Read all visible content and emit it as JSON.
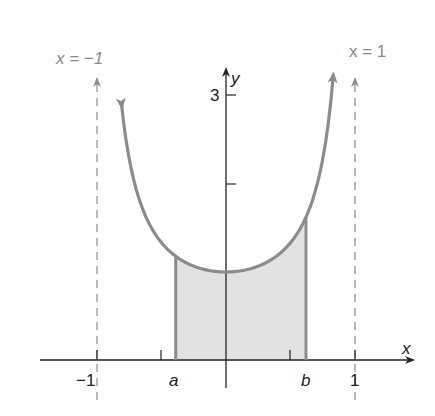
{
  "figure": {
    "vertical_asymptote_left_label": "x = −1",
    "vertical_asymptote_right_label": "x = 1",
    "y_axis_label": "y",
    "x_axis_label": "x",
    "y_tick_label_3": "3",
    "x_tick_labels": {
      "neg_one": "−1",
      "a": "a",
      "b": "b",
      "one": "1"
    },
    "colors": {
      "curve": "#8c8c8c",
      "asymptote": "#8a8a8a",
      "axis": "#222222",
      "shade": "#e2e2e2",
      "bounds": "#8c8c8c"
    }
  },
  "chart_data": {
    "type": "line",
    "title": "",
    "function": "y = 1/(1 - x^2) on (-1, 1), shaded region between x = a and x = b",
    "xlabel": "x",
    "ylabel": "y",
    "x_ticks": [
      "-1",
      "a",
      "b",
      "1"
    ],
    "y_ticks": [
      2,
      3
    ],
    "y_tick_labels": [
      "",
      "3"
    ],
    "asymptotes": [
      "x = -1",
      "x = 1"
    ],
    "minimum": {
      "x": 0,
      "y": 1
    },
    "shaded_interval": {
      "a": -0.39,
      "b": 0.62
    },
    "xlim": [
      -1.4,
      1.4
    ],
    "ylim": [
      0,
      3.3
    ]
  }
}
